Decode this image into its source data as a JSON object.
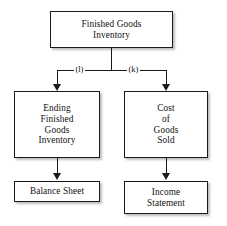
{
  "diagram": {
    "type": "flowchart",
    "line_color": "#1a1a1a",
    "box_fill": "#ffffff",
    "shadow_color": "#6e6e6e",
    "nodes": {
      "top": {
        "label": "Finished Goods Inventory",
        "line1": "Finished Goods",
        "line2": "Inventory"
      },
      "ending_inventory": {
        "label": "Ending Finished Goods Inventory",
        "line1": "Ending",
        "line2": "Finished",
        "line3": "Goods",
        "line4": "Inventory"
      },
      "cost_of_goods_sold": {
        "label": "Cost of Goods Sold",
        "line1": "Cost",
        "line2": "of",
        "line3": "Goods",
        "line4": "Sold"
      },
      "balance_sheet": {
        "label": "Balance Sheet",
        "line1": "Balance Sheet"
      },
      "income_statement": {
        "label": "Income Statement",
        "line1": "Income",
        "line2": "Statement"
      }
    },
    "edge_labels": {
      "left": "(l)",
      "right": "(k)"
    }
  }
}
